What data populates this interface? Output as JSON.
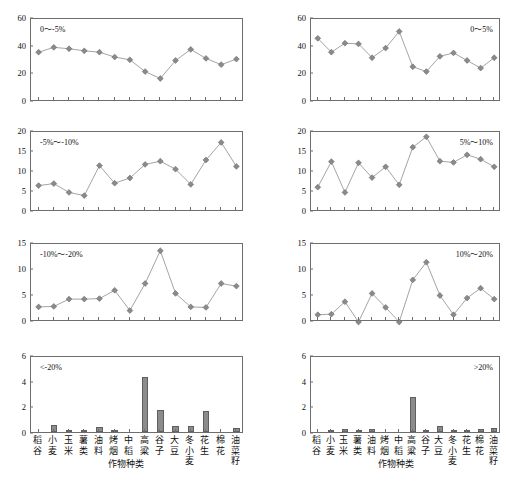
{
  "chart_data": [
    {
      "type": "line",
      "title": "",
      "panel_label": "0～-5%",
      "xlabel": "作物种类",
      "ylabel": "",
      "ylim": [
        0,
        60
      ],
      "yticks": [
        0,
        20,
        40,
        60
      ],
      "grid": false,
      "categories": [
        "稻谷",
        "小麦",
        "玉米",
        "薯类",
        "油料",
        "烤烟",
        "中稻",
        "高粱",
        "谷子",
        "大豆",
        "冬小麦",
        "花生",
        "棉花",
        "油菜籽"
      ],
      "values": [
        36.0,
        39.5,
        38.5,
        37.0,
        36.0,
        32.5,
        30.5,
        22.0,
        17.0,
        30.0,
        38.0,
        31.5,
        27.0,
        31.0
      ]
    },
    {
      "type": "line",
      "title": "",
      "panel_label": "0～5%",
      "xlabel": "作物种类",
      "ylabel": "",
      "ylim": [
        0,
        60
      ],
      "yticks": [
        0,
        20,
        40,
        60
      ],
      "grid": false,
      "categories": [
        "稻谷",
        "小麦",
        "玉米",
        "薯类",
        "油料",
        "烤烟",
        "中稻",
        "高粱",
        "谷子",
        "大豆",
        "冬小麦",
        "花生",
        "棉花",
        "油菜籽"
      ],
      "values": [
        46.0,
        36.0,
        42.5,
        42.0,
        32.0,
        39.0,
        51.0,
        25.5,
        22.0,
        33.0,
        35.5,
        30.0,
        24.5,
        32.0
      ]
    },
    {
      "type": "line",
      "title": "",
      "panel_label": "-5%～-10%",
      "xlabel": "作物种类",
      "ylabel": "",
      "ylim": [
        0,
        20
      ],
      "yticks": [
        0,
        5,
        10,
        15,
        20
      ],
      "grid": false,
      "categories": [
        "稻谷",
        "小麦",
        "玉米",
        "薯类",
        "油料",
        "烤烟",
        "中稻",
        "高粱",
        "谷子",
        "大豆",
        "冬小麦",
        "花生",
        "棉花",
        "油菜籽"
      ],
      "values": [
        6.6,
        7.1,
        4.9,
        4.1,
        11.6,
        7.2,
        8.5,
        11.9,
        12.7,
        10.7,
        6.9,
        13.0,
        17.4,
        11.4
      ]
    },
    {
      "type": "line",
      "title": "",
      "panel_label": "5%～10%",
      "xlabel": "作物种类",
      "ylabel": "",
      "ylim": [
        0,
        20
      ],
      "yticks": [
        0,
        5,
        10,
        15,
        20
      ],
      "grid": false,
      "categories": [
        "稻谷",
        "小麦",
        "玉米",
        "薯类",
        "油料",
        "烤烟",
        "中稻",
        "高粱",
        "谷子",
        "大豆",
        "冬小麦",
        "花生",
        "棉花",
        "油菜籽"
      ],
      "values": [
        6.2,
        12.6,
        4.9,
        12.3,
        8.6,
        11.3,
        6.8,
        16.2,
        18.8,
        12.7,
        12.4,
        14.3,
        13.2,
        11.3
      ]
    },
    {
      "type": "line",
      "title": "",
      "panel_label": "-10%～-20%",
      "xlabel": "作物种类",
      "ylabel": "",
      "ylim": [
        0,
        15
      ],
      "yticks": [
        0,
        5,
        10,
        15
      ],
      "grid": false,
      "categories": [
        "稻谷",
        "小麦",
        "玉米",
        "薯类",
        "油料",
        "烤烟",
        "中稻",
        "高粱",
        "谷子",
        "大豆",
        "冬小麦",
        "花生",
        "棉花",
        "油菜籽"
      ],
      "values": [
        2.9,
        3.0,
        4.4,
        4.4,
        4.5,
        6.1,
        2.2,
        7.4,
        13.7,
        5.5,
        2.9,
        2.8,
        7.4,
        6.9
      ]
    },
    {
      "type": "line",
      "title": "",
      "panel_label": "10%～20%",
      "xlabel": "作物种类",
      "ylabel": "",
      "ylim": [
        0,
        15
      ],
      "yticks": [
        0,
        5,
        10,
        15
      ],
      "grid": false,
      "categories": [
        "稻谷",
        "小麦",
        "玉米",
        "薯类",
        "油料",
        "烤烟",
        "中稻",
        "高粱",
        "谷子",
        "大豆",
        "冬小麦",
        "花生",
        "棉花",
        "油菜籽"
      ],
      "values": [
        1.4,
        1.5,
        3.9,
        0.0,
        5.5,
        2.8,
        0.0,
        8.1,
        11.5,
        5.1,
        1.4,
        4.6,
        6.5,
        4.4
      ]
    },
    {
      "type": "bar",
      "title": "",
      "panel_label": "<-20%",
      "xlabel": "作物种类",
      "ylabel": "",
      "ylim": [
        0,
        6
      ],
      "yticks": [
        0,
        2,
        4,
        6
      ],
      "grid": false,
      "categories": [
        "稻谷",
        "小麦",
        "玉米",
        "薯类",
        "油料",
        "烤烟",
        "中稻",
        "高粱",
        "谷子",
        "大豆",
        "冬小麦",
        "花生",
        "棉花",
        "油菜籽"
      ],
      "values": [
        0.0,
        0.55,
        0.06,
        0.15,
        0.42,
        0.07,
        0.0,
        4.25,
        1.75,
        0.45,
        0.5,
        1.65,
        0.0,
        0.3
      ]
    },
    {
      "type": "bar",
      "title": "",
      "panel_label": ">20%",
      "xlabel": "作物种类",
      "ylabel": "",
      "ylim": [
        0,
        6
      ],
      "yticks": [
        0,
        2,
        4,
        6
      ],
      "grid": false,
      "categories": [
        "稻谷",
        "小麦",
        "玉米",
        "薯类",
        "油料",
        "烤烟",
        "中稻",
        "高粱",
        "谷子",
        "大豆",
        "冬小麦",
        "花生",
        "棉花",
        "油菜籽"
      ],
      "values": [
        0.0,
        0.12,
        0.22,
        0.1,
        0.25,
        0.0,
        0.0,
        2.7,
        0.1,
        0.5,
        0.08,
        0.15,
        0.2,
        0.35
      ]
    }
  ],
  "style": {
    "marker_color": "#8a8a8a",
    "marker_edge": "#6a6a6a",
    "line_color": "#9a9a9a",
    "bar_color": "#8c8c8c",
    "bar_edge": "#5f5f5f",
    "axis_color": "#6e6e6e"
  },
  "axis_title": "作物种类"
}
